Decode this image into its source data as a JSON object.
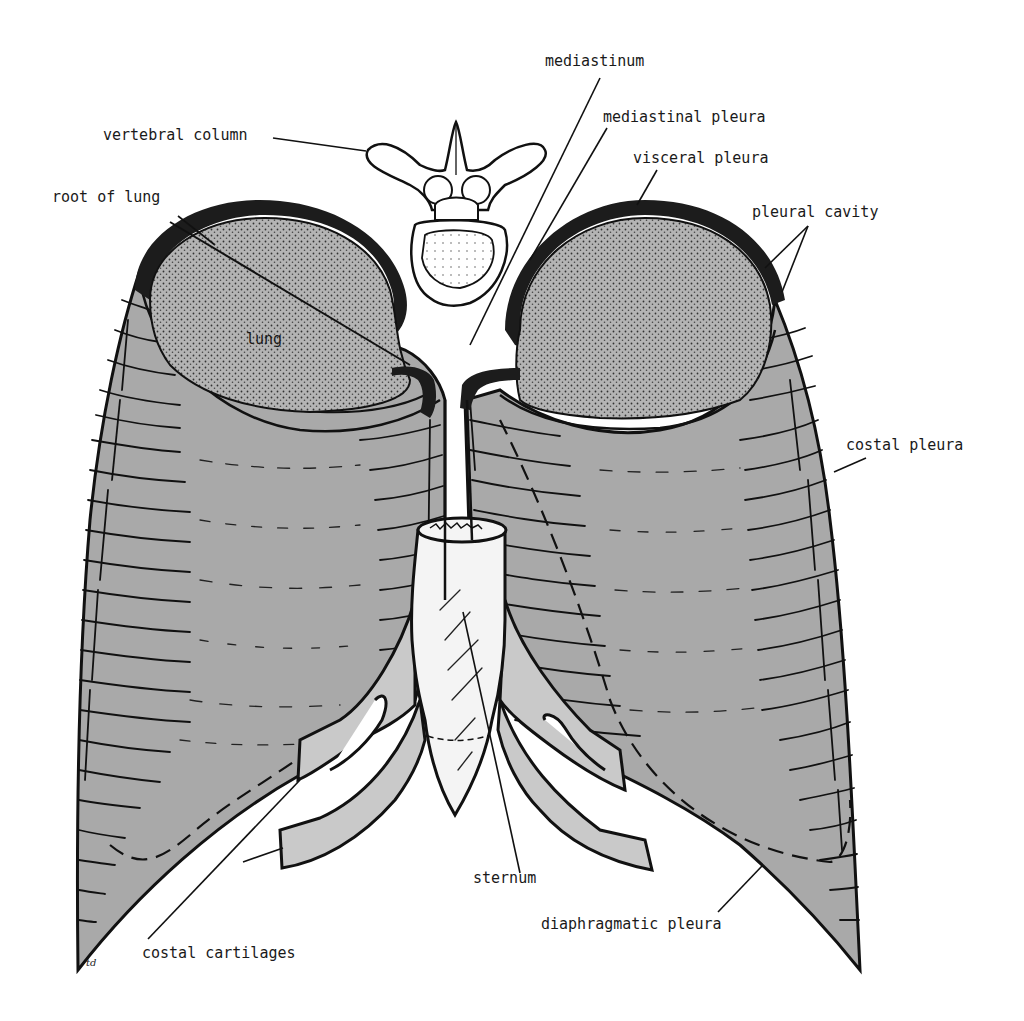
{
  "figure": {
    "colors": {
      "background": "#ffffff",
      "pleura_fill": "#a9a9a9",
      "lung_fill": "#9c9c9c",
      "parietal_dark": "#1c1c1c",
      "cartilage_fill": "#c9c9c9",
      "sternum_fill": "#f4f4f4",
      "line": "#111111"
    },
    "labels": {
      "mediastinum": "mediastinum",
      "mediastinal_pleura": "mediastinal pleura",
      "vertebral_column": "vertebral column",
      "visceral_pleura": "visceral pleura",
      "root_of_lung": "root of lung",
      "pleural_cavity": "pleural cavity",
      "lung": "lung",
      "costal_pleura": "costal pleura",
      "sternum": "sternum",
      "costal_cartilages": "costal cartilages",
      "diaphragmatic_pleura": "diaphragmatic pleura"
    },
    "signature": "td"
  }
}
